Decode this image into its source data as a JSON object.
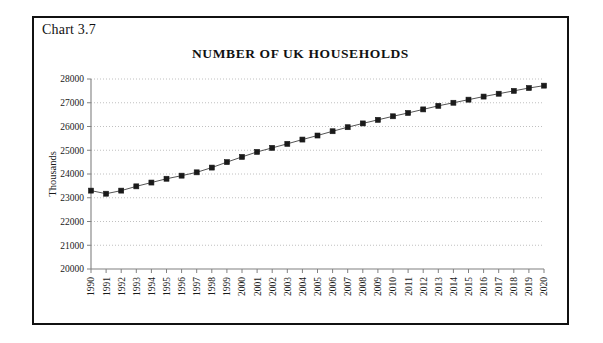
{
  "figure": {
    "label": "Chart 3.7",
    "title": "NUMBER OF UK HOUSEHOLDS"
  },
  "colors": {
    "frame": "#111111",
    "line": "#555555",
    "marker": "#1a1a1a",
    "grid": "#b9b9b9",
    "axis": "#808080",
    "text": "#1a1a1a"
  },
  "chart_data": {
    "type": "line",
    "title": "NUMBER OF UK HOUSEHOLDS",
    "xlabel": "",
    "ylabel": "Thousands",
    "ylim": [
      20000,
      28000
    ],
    "ytick_step": 1000,
    "yticks": [
      "20000",
      "21000",
      "22000",
      "23000",
      "24000",
      "25000",
      "26000",
      "27000",
      "28000"
    ],
    "grid": "horizontal-dotted",
    "legend": "none",
    "marker": "square",
    "categories": [
      "1990",
      "1991",
      "1992",
      "1993",
      "1994",
      "1995",
      "1996",
      "1997",
      "1998",
      "1999",
      "2000",
      "2001",
      "2002",
      "2003",
      "2004",
      "2005",
      "2006",
      "2007",
      "2008",
      "2009",
      "2010",
      "2011",
      "2012",
      "2013",
      "2014",
      "2015",
      "2016",
      "2017",
      "2018",
      "2019",
      "2020"
    ],
    "values": [
      23300,
      23170,
      23300,
      23480,
      23640,
      23800,
      23930,
      24070,
      24270,
      24500,
      24720,
      24930,
      25100,
      25270,
      25450,
      25620,
      25800,
      25970,
      26130,
      26280,
      26430,
      26570,
      26720,
      26870,
      27000,
      27130,
      27260,
      27380,
      27500,
      27620,
      27720
    ],
    "series": [
      {
        "name": "UK households",
        "values": [
          23300,
          23170,
          23300,
          23480,
          23640,
          23800,
          23930,
          24070,
          24270,
          24500,
          24720,
          24930,
          25100,
          25270,
          25450,
          25620,
          25800,
          25970,
          26130,
          26280,
          26430,
          26570,
          26720,
          26870,
          27000,
          27130,
          27260,
          27380,
          27500,
          27620,
          27720
        ]
      }
    ]
  }
}
